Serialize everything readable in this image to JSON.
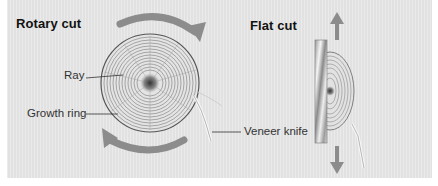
{
  "diagram": {
    "sections": [
      {
        "title": "Rotary cut",
        "labels": {
          "ray": "Ray",
          "growth_ring": "Growth ring",
          "veneer_knife": "Veneer knife"
        }
      },
      {
        "title": "Flat cut"
      }
    ],
    "colors": {
      "panel": "#e6e6e6",
      "arrow": "#8c8c8c",
      "ring_line": "#6a6a6a",
      "text": "#111111"
    }
  }
}
